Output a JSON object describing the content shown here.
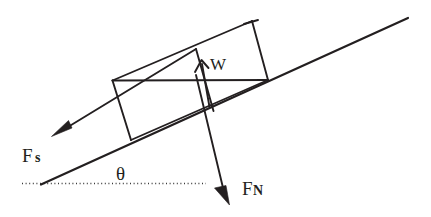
{
  "figure": {
    "type": "free-body-diagram",
    "background_color": "#ffffff",
    "ink_color": "#231f20"
  },
  "labels": {
    "friction_force": "F",
    "friction_force_sub": "s",
    "normal_force": "F",
    "normal_force_sub": "N",
    "weight": "W",
    "angle": "θ"
  },
  "geometry": {
    "incline": {
      "name": "inclined-plane-surface",
      "x1": 41,
      "y1": 184,
      "x2": 408,
      "y2": 18,
      "angle_degrees": 24.3
    },
    "ground_dotted": {
      "name": "horizontal-reference-line",
      "x1": 22,
      "y1": 183,
      "x2": 206,
      "y2": 183
    },
    "block": {
      "name": "block-on-incline",
      "shape": "parallelogram",
      "corners": [
        [
          113,
          80
        ],
        [
          252,
          21
        ],
        [
          268,
          80
        ],
        [
          131,
          140
        ]
      ],
      "inner_lines": [
        [
          [
            113,
            80
          ],
          [
            268,
            80
          ]
        ],
        [
          [
            196,
            49
          ],
          [
            213,
            110
          ]
        ]
      ]
    },
    "vectors": [
      {
        "name": "friction-force-vector",
        "label_key": "friction_force",
        "tail": [
          196,
          49
        ],
        "head": [
          52,
          135
        ],
        "direction": "down-left along incline"
      },
      {
        "name": "weight-vector",
        "label_key": "weight",
        "tail": [
          209,
          106
        ],
        "head": [
          201,
          61
        ],
        "direction": "up along block face"
      },
      {
        "name": "normal-force-vector",
        "label_key": "normal_force",
        "tail": [
          196,
          75
        ],
        "head": [
          229,
          204
        ],
        "direction": "down-right, perpendicular-ish to incline"
      }
    ],
    "label_positions": {
      "friction_force": [
        22,
        161
      ],
      "normal_force": [
        242,
        194
      ],
      "weight": [
        211,
        69
      ],
      "angle": [
        117,
        178
      ]
    }
  }
}
